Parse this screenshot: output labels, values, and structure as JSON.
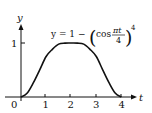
{
  "chart_data": {
    "type": "line",
    "title": "",
    "equation": {
      "lhs": "y = 1 − ",
      "func": "cos",
      "num": "πt",
      "den": "4",
      "exp": "4"
    },
    "xlabel": "t",
    "ylabel": "y",
    "origin_label": "0",
    "x_ticks": [
      "1",
      "2",
      "3",
      "4"
    ],
    "y_ticks": [
      "1"
    ],
    "xlim": [
      0,
      4.3
    ],
    "ylim": [
      0,
      1.2
    ],
    "grid": false,
    "legend": "none",
    "series": [
      {
        "name": "y = 1 - (cos(pi t / 4))^4",
        "x": [
          0,
          0.25,
          0.5,
          0.75,
          1.0,
          1.25,
          1.5,
          1.75,
          2.0,
          2.25,
          2.5,
          2.75,
          3.0,
          3.25,
          3.5,
          3.75,
          4.0
        ],
        "y": [
          0,
          0.075,
          0.271,
          0.508,
          0.75,
          0.883,
          0.979,
          0.998,
          1.0,
          0.998,
          0.979,
          0.883,
          0.75,
          0.508,
          0.271,
          0.075,
          0
        ]
      }
    ],
    "color": "#111111"
  }
}
